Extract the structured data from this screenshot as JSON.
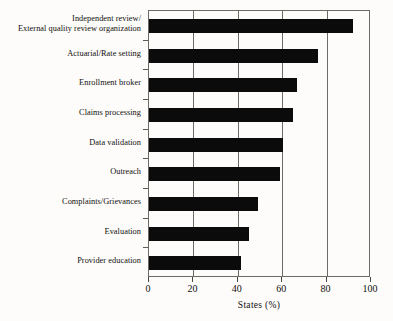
{
  "chart_data": {
    "type": "bar",
    "orientation": "horizontal",
    "title": "",
    "xlabel": "States (%)",
    "ylabel": "",
    "xlim": [
      0,
      100
    ],
    "xticks": [
      0,
      20,
      40,
      60,
      80,
      100
    ],
    "xticklabels": [
      "0",
      "20",
      "40",
      "60",
      "80",
      "100"
    ],
    "grid": "vertical",
    "legend": "none",
    "bar_color": "#0b0b0b",
    "categories": [
      "Independent review/\nExternal quality review organization",
      "Actuarial/Rate setting",
      "Enrollment broker",
      "Claims processing",
      "Data validation",
      "Outreach",
      "Complaints/Grievances",
      "Evaluation",
      "Provider education"
    ],
    "values": [
      92,
      76,
      66.5,
      65,
      60.5,
      59,
      49,
      45,
      41.5
    ]
  },
  "axis": {
    "x_title": "States (%)"
  }
}
